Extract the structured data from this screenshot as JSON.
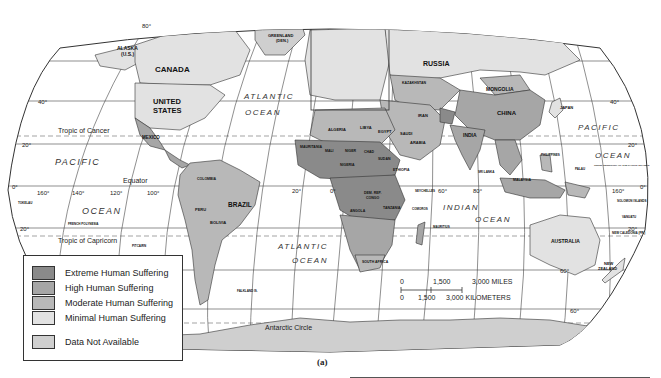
{
  "legend": {
    "items": [
      {
        "label": "Extreme Human Suffering",
        "color": "#8a8a8a"
      },
      {
        "label": "High Human Suffering",
        "color": "#a6a6a6"
      },
      {
        "label": "Moderate Human Suffering",
        "color": "#b8b8b8"
      },
      {
        "label": "Minimal Human Suffering",
        "color": "#e2e2e2"
      }
    ],
    "na_item": {
      "label": "Data Not Available",
      "color": "#cfcfcf"
    }
  },
  "scale": {
    "miles_labels": [
      "0",
      "1,500",
      "3,000 MILES"
    ],
    "km_labels": [
      "0",
      "1,500",
      "3,000 KILOMETERS"
    ]
  },
  "lines": {
    "tropic_cancer": "Tropic of Cancer",
    "equator": "Equator",
    "tropic_capricorn": "Tropic of Capricorn",
    "antarctic_circle": "Antarctic Circle"
  },
  "latitudes": [
    "80°",
    "40°",
    "20°",
    "0°",
    "20°",
    "60°",
    "40°",
    "20°",
    "0°",
    "20°",
    "60°"
  ],
  "longitudes": [
    "160°",
    "140°",
    "120°",
    "100°",
    "20°",
    "0°",
    "60°",
    "80°",
    "160°"
  ],
  "oceans": {
    "pacific_left": "PACIFIC",
    "ocean_left": "OCEAN",
    "atlantic_top": "ATLANTIC",
    "ocean_atl_top": "OCEAN",
    "atlantic_bottom": "ATLANTIC",
    "ocean_atl_bottom": "OCEAN",
    "indian": "INDIAN",
    "ocean_indian": "OCEAN",
    "pacific_right": "PACIFIC",
    "ocean_right": "OCEAN"
  },
  "countries": {
    "alaska": "ALASKA",
    "alaska_us": "(U.S.)",
    "canada": "CANADA",
    "united": "UNITED",
    "states": "STATES",
    "greenland": "GREENLAND",
    "greenland_den": "(DEN.)",
    "mexico": "MEXICO",
    "brazil": "BRAZIL",
    "peru": "PERU",
    "bolivia": "BOLIVIA",
    "argentina": "ARGENTINA",
    "colombia": "COLOMBIA",
    "venezuela": "VENEZUELA",
    "russia": "RUSSIA",
    "kazakhstan": "KAZAKHSTAN",
    "mongolia": "MONGOLIA",
    "china": "CHINA",
    "japan": "JAPAN",
    "india": "INDIA",
    "iran": "IRAN",
    "saudi": "SAUDI",
    "arabia": "ARABIA",
    "algeria": "ALGERIA",
    "libya": "LIBYA",
    "egypt": "EGYPT",
    "mali": "MALI",
    "niger": "NIGER",
    "chad": "CHAD",
    "sudan": "SUDAN",
    "mauritania": "MAURITANIA",
    "nigeria": "NIGERIA",
    "ethiopia": "ETHIOPIA",
    "dem_rep": "DEM. REP.",
    "congo": "CONGO",
    "angola": "ANGOLA",
    "tanzania": "TANZANIA",
    "south_africa": "SOUTH AFRICA",
    "madagascar": "MADAGASCAR",
    "australia": "AUSTRALIA",
    "new": "NEW",
    "zealand": "ZEALAND",
    "indonesia": "INDONESIA",
    "malaysia": "MALAYSIA",
    "papua": "PAPUA NEW GUINEA",
    "philippines": "PHILIPPINES",
    "thailand": "THAILAND",
    "sri_lanka": "SRI LANKA",
    "finland": "FINLAND",
    "afghanistan": "AFG.",
    "seychelles": "SEYCHELLES",
    "comoros": "COMOROS",
    "mauritius": "MAURITIUS",
    "french_polynesia": "FRENCH POLYNESIA",
    "tokelau": "TOKELAU",
    "pitcairn": "PITCAIRN",
    "falkland": "FALKLAND IS.",
    "solomon": "SOLOMON ISLANDS",
    "palau": "PALAU",
    "trust_territory": "TRUST TERRITORY OF THE PACIFIC ISLANDS",
    "vanuatu": "VANUATU",
    "new_caledonia": "NEW CALEDONIA (FR.)",
    "fr_guiana": "FR. GUIANA (FR.)",
    "suriname": "SURINAME",
    "guatemala": "GUATEMALA",
    "el_salvador": "EL SALVADOR",
    "nicaragua": "NICARAGUA",
    "costa_rica": "COSTA RICA",
    "panama": "PANAMA",
    "bahamas": "BAHAMAS",
    "st_lucia": "ST. LUCIA",
    "trinidad": "TRINIDAD & TOBAGO",
    "ecuador": "ECUADOR",
    "uruguay": "URUGUAY",
    "yemen": "YEMEN",
    "somalia": "SOMALIA",
    "kenya": "KENYA",
    "botswana": "BOTSWANA",
    "mozambique": "MOZAMBIQUE",
    "sierra_leone": "SIERRA LEONE",
    "liberia": "LIBERIA"
  },
  "caption": "(a)"
}
